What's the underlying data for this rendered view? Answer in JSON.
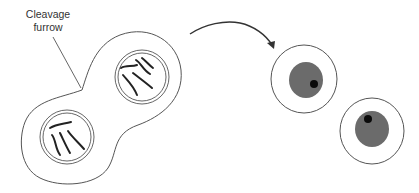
{
  "labels": {
    "cleavage_furrow_line1": "Cleavage",
    "cleavage_furrow_line2": "furrow"
  },
  "colors": {
    "outline": "#555555",
    "chromosome": "#222222",
    "nucleus": "#6b6b6b",
    "nucleolus": "#0a0a0a",
    "arrow": "#333333",
    "background": "#ffffff"
  },
  "figure": {
    "left_stage": "dividing cell with cleavage furrow and two nuclei containing chromosomes",
    "transition": "curved arrow",
    "right_stage": "two daughter cells each with nucleus and nucleolus"
  }
}
